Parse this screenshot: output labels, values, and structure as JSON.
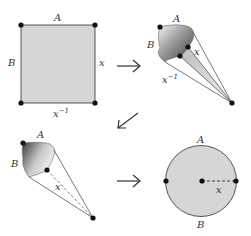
{
  "diagram": {
    "colors": {
      "fill_light": "#d6d6d6",
      "stroke": "#555555",
      "dot": "#111111",
      "arrow": "#333333"
    },
    "panels": [
      {
        "id": "square",
        "labels": {
          "top": "A",
          "left": "B",
          "right": "x",
          "bottom_base": "x",
          "bottom_sup": "−1"
        }
      },
      {
        "id": "cone",
        "labels": {
          "top": "A",
          "left": "B",
          "right": "x",
          "bottom_base": "x",
          "bottom_sup": "−1"
        }
      },
      {
        "id": "folded-cone",
        "labels": {
          "top": "A",
          "left": "B",
          "inner": "x"
        }
      },
      {
        "id": "disk",
        "labels": {
          "top": "A",
          "bottom": "B",
          "radius": "x"
        }
      }
    ],
    "arrows": [
      {
        "from": "square",
        "to": "cone",
        "direction": "right"
      },
      {
        "from": "cone",
        "to": "folded-cone",
        "direction": "down-left"
      },
      {
        "from": "folded-cone",
        "to": "disk",
        "direction": "right"
      }
    ]
  }
}
